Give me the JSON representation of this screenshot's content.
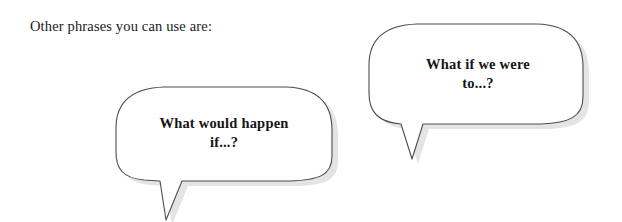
{
  "page": {
    "background_color": "#ffffff",
    "intro_text": "Other phrases you can use are:"
  },
  "bubbles": [
    {
      "id": "bubble-one",
      "name": "speech-bubble-what-would-happen",
      "line1": "What would happen",
      "line2": "if...?",
      "stroke_color": "#4d4d4d",
      "fill_color": "#ffffff",
      "shadow_color": "#e2e2e2",
      "tail_direction": "down-left"
    },
    {
      "id": "bubble-two",
      "name": "speech-bubble-what-if-we-were-to",
      "line1": "What if we were",
      "line2": "to...?",
      "stroke_color": "#4d4d4d",
      "fill_color": "#ffffff",
      "shadow_color": "#e2e2e2",
      "tail_direction": "down-left"
    }
  ]
}
